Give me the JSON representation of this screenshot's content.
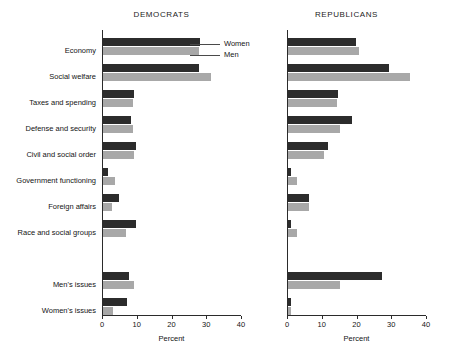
{
  "chart_data": {
    "type": "bar",
    "orientation": "horizontal",
    "title": "",
    "xlabel": "Percent",
    "ylabel": "",
    "xlim": [
      0,
      40
    ],
    "xticks": [
      0,
      10,
      20,
      30,
      40
    ],
    "grid": false,
    "legend": {
      "position": "inside-top-right-democrats",
      "entries": [
        {
          "name": "Women",
          "color": "#2c2c2c"
        },
        {
          "name": "Men",
          "color": "#a8a8a8"
        }
      ]
    },
    "categories": [
      "Economy",
      "Social welfare",
      "Taxes and spending",
      "Defense and security",
      "Civil and social order",
      "Government functioning",
      "Foreign affairs",
      "Race and social groups",
      "Men's issues",
      "Women's issues"
    ],
    "panels": [
      {
        "title": "DEMOCRATS",
        "series": [
          {
            "name": "Women",
            "color": "#2c2c2c",
            "values": [
              28.0,
              27.5,
              9.0,
              8.0,
              9.5,
              1.5,
              4.5,
              9.5,
              7.5,
              7.0
            ]
          },
          {
            "name": "Men",
            "color": "#a8a8a8",
            "values": [
              27.5,
              31.0,
              8.5,
              8.5,
              9.0,
              3.5,
              2.5,
              6.5,
              9.0,
              3.0
            ]
          }
        ]
      },
      {
        "title": "REPUBLICANS",
        "series": [
          {
            "name": "Women",
            "color": "#2c2c2c",
            "values": [
              19.5,
              29.0,
              14.5,
              18.5,
              11.5,
              1.0,
              6.0,
              1.0,
              27.0,
              1.0
            ]
          },
          {
            "name": "Men",
            "color": "#a8a8a8",
            "values": [
              20.5,
              35.0,
              14.0,
              15.0,
              10.5,
              2.5,
              6.0,
              2.5,
              15.0,
              0.8
            ]
          }
        ]
      }
    ]
  }
}
